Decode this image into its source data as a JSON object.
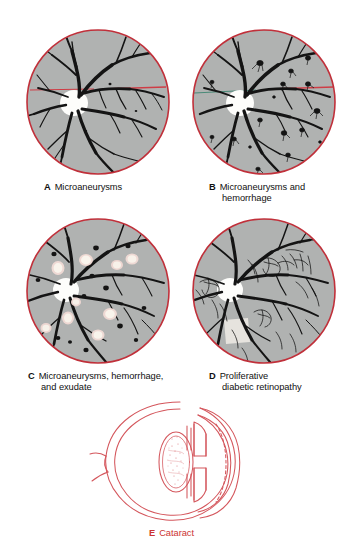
{
  "figure": {
    "background_color": "#ffffff"
  },
  "colors": {
    "rim_red": "#c0303a",
    "fundus_gray": "#b0b2b1",
    "vessel_black": "#141414",
    "optic_disc_white": "#fdfdfb",
    "exudate_cream": "#f6f0e6",
    "exudate_halo": "#e8b9b3",
    "caption_black": "#111111",
    "caption_red": "#cc3333",
    "eye_line_red": "#d4565c"
  },
  "panels": [
    {
      "id": "a",
      "label": "A",
      "text": "Microaneurysms",
      "lines": [
        "Microaneurysms"
      ],
      "kind": "fundus",
      "features": [
        "retinal-vessels",
        "optic-disc",
        "microaneurysms",
        "red-reference-line"
      ]
    },
    {
      "id": "b",
      "label": "B",
      "text": "Microaneurysms and hemorrhage",
      "lines": [
        "Microaneurysms and",
        "hemorrhage"
      ],
      "kind": "fundus",
      "features": [
        "retinal-vessels",
        "optic-disc",
        "microaneurysms",
        "flame-hemorrhages",
        "red-reference-line"
      ]
    },
    {
      "id": "c",
      "label": "C",
      "text": "Microaneurysms, hemorrhage, and exudate",
      "lines": [
        "Microaneurysms, hemorrhage,",
        "and exudate"
      ],
      "kind": "fundus",
      "features": [
        "retinal-vessels",
        "optic-disc",
        "microaneurysms",
        "hemorrhages",
        "hard-exudates"
      ]
    },
    {
      "id": "d",
      "label": "D",
      "text": "Proliferative diabetic retinopathy",
      "lines": [
        "Proliferative",
        "diabetic retinopathy"
      ],
      "kind": "fundus",
      "features": [
        "retinal-vessels",
        "optic-disc",
        "neovascularization",
        "fibrous-proliferation"
      ]
    },
    {
      "id": "e",
      "label": "E",
      "text": "Cataract",
      "lines": [
        "Cataract"
      ],
      "kind": "eye-cross-section",
      "features": [
        "cornea",
        "anterior-chamber",
        "iris",
        "opacified-lens",
        "sclera",
        "optic-nerve"
      ]
    }
  ]
}
